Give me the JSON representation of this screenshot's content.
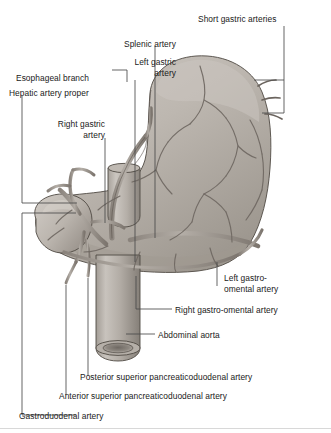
{
  "figure": {
    "style": "grayscale anatomical illustration",
    "colors": {
      "text": "#1a1a1a",
      "leader": "#4a4a4a",
      "organ_light": "#d6d2cd",
      "organ_mid": "#b3aea8",
      "organ_dark": "#8e8881",
      "vessel": "#6f6862",
      "background": "#ffffff",
      "rule": "#d8d8d8"
    }
  },
  "labels": [
    {
      "id": "short-gastric-arteries",
      "text": "Short gastric arteries",
      "x": 198,
      "y": 14,
      "align": "left"
    },
    {
      "id": "splenic-artery",
      "text": "Splenic artery",
      "x": 124,
      "y": 39,
      "align": "left"
    },
    {
      "id": "left-gastric-artery",
      "line1": "Left gastric",
      "line2": "artery",
      "x": 110,
      "y": 57,
      "align": "left"
    },
    {
      "id": "esophageal-branch",
      "text": "Esophageal branch",
      "x": 16,
      "y": 73,
      "align": "left"
    },
    {
      "id": "hepatic-artery-proper",
      "text": "Hepatic artery proper",
      "x": 9,
      "y": 88,
      "align": "left"
    },
    {
      "id": "right-gastric-artery",
      "line1": "Right gastric",
      "line2": "artery",
      "x": 44,
      "y": 119,
      "align": "left"
    },
    {
      "id": "left-gastro-omental-artery",
      "line1": "Left gastro-",
      "line2": "omental artery",
      "x": 224,
      "y": 273,
      "align": "left"
    },
    {
      "id": "right-gastro-omental-artery",
      "text": "Right gastro-omental artery",
      "x": 175,
      "y": 305,
      "align": "left"
    },
    {
      "id": "abdominal-aorta",
      "text": "Abdominal aorta",
      "x": 158,
      "y": 330,
      "align": "left"
    },
    {
      "id": "posterior-superior-pancreaticoduodenal-artery",
      "text": "Posterior superior pancreaticoduodenal artery",
      "x": 80,
      "y": 372,
      "align": "left"
    },
    {
      "id": "anterior-superior-pancreaticoduodenal-artery",
      "text": "Anterior superior pancreaticoduodenal artery",
      "x": 59,
      "y": 391,
      "align": "left"
    },
    {
      "id": "gastroduodenal-artery",
      "text": "Gastroduodenal artery",
      "x": 19,
      "y": 411,
      "align": "left"
    }
  ],
  "anatomy": {
    "structures": [
      "stomach fundus",
      "stomach body",
      "greater curvature",
      "lesser curvature",
      "pylorus",
      "duodenum",
      "abdominal aorta",
      "esophagus"
    ]
  }
}
